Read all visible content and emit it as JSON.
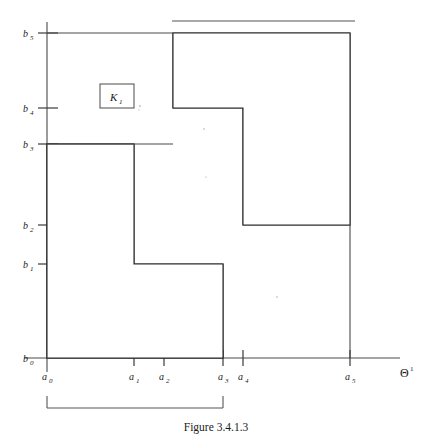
{
  "figure": {
    "caption": "Figure 3.4.1.3",
    "axis_label_x": "Θ",
    "axis_label_x_sup": "1",
    "region_label": "K",
    "region_label_sub": "1"
  },
  "x_axis": {
    "name": "theta-1-axis",
    "ticks": [
      {
        "label": "a",
        "sub": "0",
        "px": 47
      },
      {
        "label": "a",
        "sub": "1",
        "px": 134
      },
      {
        "label": "a",
        "sub": "2",
        "px": 164
      },
      {
        "label": "a",
        "sub": "3",
        "px": 223
      },
      {
        "label": "a",
        "sub": "4",
        "px": 243
      },
      {
        "label": "a",
        "sub": "5",
        "px": 350
      }
    ],
    "line_start_px": 24,
    "line_end_px": 400,
    "line_y_px": 358
  },
  "y_axis": {
    "name": "b-axis",
    "ticks": [
      {
        "label": "b",
        "sub": "0",
        "px": 358
      },
      {
        "label": "b",
        "sub": "1",
        "px": 264
      },
      {
        "label": "b",
        "sub": "2",
        "px": 225
      },
      {
        "label": "b",
        "sub": "3",
        "px": 144
      },
      {
        "label": "b",
        "sub": "4",
        "px": 108
      },
      {
        "label": "b",
        "sub": "5",
        "px": 33
      }
    ],
    "line_x_px": 47,
    "line_top_px": 22,
    "line_bottom_px": 372
  },
  "chart_data": {
    "type": "diagram",
    "title": "Figure 3.4.1.3",
    "xlabel": "Θ¹",
    "ylabel": "",
    "grid": false,
    "legend": false,
    "x_ticks": [
      "a0",
      "a1",
      "a2",
      "a3",
      "a4",
      "a5"
    ],
    "y_ticks": [
      "b0",
      "b1",
      "b2",
      "b3",
      "b4",
      "b5"
    ],
    "regions": [
      {
        "name": "lower-left-L-region",
        "hatched": true,
        "vertices_symbolic": [
          [
            "a0",
            "b0"
          ],
          [
            "a3",
            "b0"
          ],
          [
            "a3",
            "b1"
          ],
          [
            "a1",
            "b1"
          ],
          [
            "a1",
            "b3"
          ],
          [
            "a0",
            "b3"
          ]
        ],
        "vertices_px": [
          [
            47,
            358
          ],
          [
            223,
            358
          ],
          [
            223,
            264
          ],
          [
            134,
            264
          ],
          [
            134,
            144
          ],
          [
            47,
            144
          ]
        ]
      },
      {
        "name": "upper-right-L-region",
        "hatched": true,
        "vertices_symbolic": [
          [
            "a2",
            "b5"
          ],
          [
            "a5",
            "b5"
          ],
          [
            "a5",
            "b2"
          ],
          [
            "a4",
            "b2"
          ],
          [
            "a4",
            "b4"
          ],
          [
            "a2",
            "b4"
          ]
        ],
        "vertices_px": [
          [
            173,
            33
          ],
          [
            350,
            33
          ],
          [
            350,
            225
          ],
          [
            243,
            225
          ],
          [
            243,
            108
          ],
          [
            173,
            108
          ]
        ]
      }
    ],
    "brackets": [
      {
        "name": "top-bracket",
        "from_symbolic": "a2",
        "to_symbolic": "a5",
        "x_from_px": 172,
        "x_to_px": 355,
        "y_px": 21
      },
      {
        "name": "bottom-bracket",
        "from_symbolic": "a0",
        "to_symbolic": "a3",
        "x_from_px": 47,
        "x_to_px": 223,
        "y_px": 408
      }
    ],
    "callout_box": {
      "name": "k1-callout",
      "label": "K₁",
      "x_px": 100,
      "y_px": 84,
      "w_px": 34,
      "h_px": 24
    },
    "hatch": {
      "angle_deg": 45,
      "spacing_px": 17,
      "color": "#2b2b2b"
    }
  },
  "colors": {
    "ink": "#2b2b2b",
    "axis": "#4a4a4a",
    "background": "#ffffff"
  }
}
